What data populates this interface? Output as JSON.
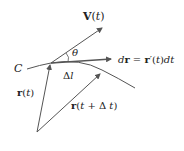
{
  "diagram": {
    "labels": {
      "curve": "C",
      "velocity": "V(t)",
      "angle": "θ",
      "differential": "dr = r′(t)dt",
      "arc": "Δl",
      "position_t": "r(t)",
      "position_t_dt": "r(t + Δ t)"
    },
    "colors": {
      "line": "#555555",
      "text": "#222222",
      "background": "#ffffff"
    }
  }
}
